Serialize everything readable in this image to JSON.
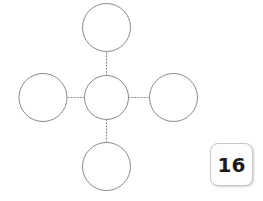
{
  "page": {
    "background_color": "#ffffff",
    "width": 263,
    "height": 201
  },
  "diagram": {
    "type": "bubble-map",
    "stroke_color": "#8a8a8a",
    "fill_color": "#ffffff",
    "connector_color": "#8a8a8a",
    "connector_style": "dotted",
    "center_node": {
      "name": "center-circle",
      "label": "",
      "cx": 106.5,
      "cy": 97.5,
      "r": 22
    },
    "outer_nodes": [
      {
        "name": "top-circle",
        "label": "",
        "cx": 106.5,
        "cy": 27.5,
        "r": 24
      },
      {
        "name": "left-circle",
        "label": "",
        "cx": 43.0,
        "cy": 97.5,
        "r": 24
      },
      {
        "name": "right-circle",
        "label": "",
        "cx": 173.5,
        "cy": 97.5,
        "r": 24
      },
      {
        "name": "bottom-circle",
        "label": "",
        "cx": 106.5,
        "cy": 166.5,
        "r": 24
      }
    ],
    "connectors": [
      {
        "name": "connector-center-top",
        "x1": 106.5,
        "y1": 75.5,
        "x2": 106.5,
        "y2": 51.5
      },
      {
        "name": "connector-center-left",
        "x1": 84.5,
        "y1": 97.5,
        "x2": 67.0,
        "y2": 97.5
      },
      {
        "name": "connector-center-right",
        "x1": 128.5,
        "y1": 97.5,
        "x2": 149.5,
        "y2": 97.5
      },
      {
        "name": "connector-center-bottom",
        "x1": 106.5,
        "y1": 119.5,
        "x2": 106.5,
        "y2": 142.5
      }
    ]
  },
  "number_tile": {
    "value": "16",
    "background_color": "#fdfdfd",
    "border_color": "#c9c9c9",
    "text_color": "#1b1b1b"
  }
}
